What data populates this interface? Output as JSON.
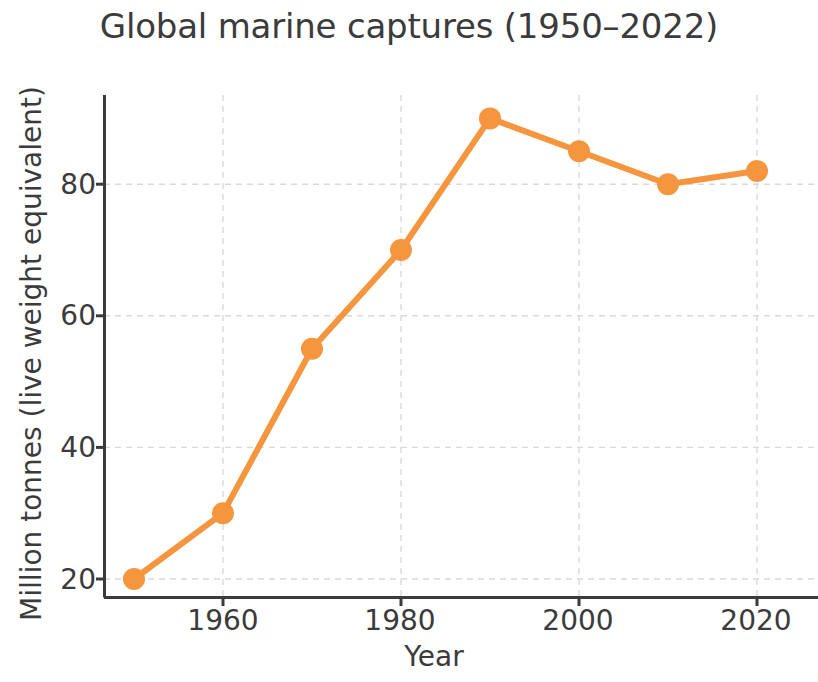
{
  "chart_data": {
    "type": "line",
    "title": "Global marine captures (1950–2022)",
    "xlabel": "Year",
    "ylabel": "Million tonnes (live weight equivalent)",
    "x": [
      1950,
      1960,
      1970,
      1980,
      1990,
      2000,
      2010,
      2020
    ],
    "values": [
      20,
      30,
      55,
      70,
      90,
      85,
      80,
      82
    ],
    "series": [
      {
        "name": "Global marine captures",
        "color": "#F5963F",
        "values": [
          20,
          30,
          55,
          70,
          90,
          85,
          80,
          82
        ]
      }
    ],
    "xlim": [
      1946,
      2026
    ],
    "ylim": [
      16.5,
      95.5
    ],
    "xticks": [
      1960,
      1980,
      2000,
      2020
    ],
    "xtick_labels": [
      "1960",
      "1980",
      "2000",
      "2020"
    ],
    "yticks": [
      20,
      40,
      60,
      80
    ],
    "ytick_labels": [
      "20",
      "40",
      "60",
      "80"
    ],
    "grid": true,
    "grid_style": "dashed",
    "grid_color": "#d9d9d9",
    "legend": false,
    "marker": "circle",
    "marker_size": 11,
    "line_width": 6,
    "axis_color": "#3b3b3b",
    "text_color": "#3b3b3b",
    "background": "#ffffff"
  }
}
